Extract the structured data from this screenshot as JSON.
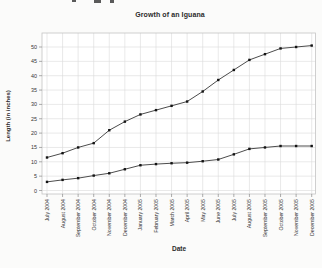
{
  "top_fragment": {
    "note": "partially clipped text pixels at very top edge"
  },
  "chart_data": {
    "type": "line",
    "title": "Growth of an Iguana",
    "xlabel": "Date",
    "ylabel": "Length (in inches)",
    "categories": [
      "July 2004",
      "August 2004",
      "September 2004",
      "October 2004",
      "November 2004",
      "December 2004",
      "January 2005",
      "February 2005",
      "March 2005",
      "April 2005",
      "May 2005",
      "June 2005",
      "July 2005",
      "August 2005",
      "September 2005",
      "October 2005",
      "November 2005",
      "December 2005"
    ],
    "series": [
      {
        "values": [
          11.5,
          13,
          15,
          16.5,
          21,
          24,
          26.5,
          28,
          29.5,
          31,
          34.5,
          38.5,
          42,
          45.5,
          47.5,
          49.5,
          50,
          50.5
        ]
      },
      {
        "values": [
          3,
          3.7,
          4.3,
          5.2,
          6,
          7.4,
          8.8,
          9.2,
          9.5,
          9.7,
          10.2,
          10.8,
          12.6,
          14.5,
          15,
          15.5,
          15.5,
          15.5
        ]
      }
    ],
    "ylim": [
      0,
      55
    ],
    "yticks": [
      0,
      5,
      10,
      15,
      20,
      25,
      30,
      35,
      40,
      45,
      50
    ],
    "grid": true,
    "legend_position": "none",
    "marker": "square",
    "colors": {
      "line": "#4c4c4c",
      "marker": "#141414",
      "grid": "#dadada",
      "axis_box": "#c4c4c4",
      "tick": "#8a8a8a",
      "tick_label": "#333333",
      "plot_bg": "#ffffff"
    }
  }
}
